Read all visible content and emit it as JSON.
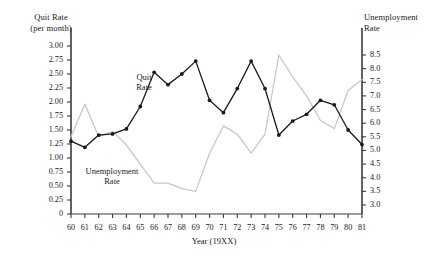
{
  "chart_data": {
    "type": "line",
    "title": "",
    "xlabel": "Year (19XX)",
    "ylabel": "Quit Rate (per month)",
    "y2label": "Unemployment Rate",
    "categories": [
      "60",
      "61",
      "62",
      "63",
      "64",
      "65",
      "66",
      "67",
      "68",
      "69",
      "70",
      "71",
      "72",
      "73",
      "74",
      "75",
      "76",
      "77",
      "78",
      "79",
      "80",
      "81"
    ],
    "ylim": [
      0,
      3.0
    ],
    "y2lim": [
      3.0,
      8.5
    ],
    "yticks": [
      "0",
      "0.25",
      "0.50",
      "0.75",
      "1.00",
      "1.25",
      "1.50",
      "1.75",
      "2.00",
      "2.25",
      "2.50",
      "2.75",
      "3.00"
    ],
    "ytick_values": [
      0,
      0.25,
      0.5,
      0.75,
      1.0,
      1.25,
      1.5,
      1.75,
      2.0,
      2.25,
      2.5,
      2.75,
      3.0
    ],
    "y2ticks": [
      "3.0",
      "3.5",
      "4.0",
      "4.5",
      "5.0",
      "5.5",
      "6.0",
      "6.5",
      "7.0",
      "7.5",
      "8.0",
      "8.5"
    ],
    "y2tick_values": [
      3.0,
      3.5,
      4.0,
      4.5,
      5.0,
      5.5,
      6.0,
      6.5,
      7.0,
      7.5,
      8.0,
      8.5
    ],
    "grid": false,
    "legend_position": "inline-annotations",
    "series": [
      {
        "name": "Quit Rate",
        "axis": "left",
        "color": "#1a1a1a",
        "markers": true,
        "values": [
          1.3,
          1.19,
          1.41,
          1.43,
          1.52,
          1.92,
          2.53,
          2.31,
          2.5,
          2.73,
          2.03,
          1.81,
          2.24,
          2.73,
          2.24,
          1.41,
          1.66,
          1.78,
          2.03,
          1.95,
          1.5,
          1.24
        ]
      },
      {
        "name": "Unemployment Rate",
        "axis": "right",
        "color": "#c8c8c8",
        "markers": false,
        "values": [
          5.5,
          6.7,
          5.5,
          5.7,
          5.2,
          4.5,
          3.8,
          3.8,
          3.6,
          3.5,
          4.9,
          5.9,
          5.6,
          4.9,
          5.6,
          8.5,
          7.7,
          7.0,
          6.1,
          5.8,
          7.2,
          7.6
        ]
      }
    ],
    "annotations": [
      {
        "name": "quit-rate-label",
        "text": "Quit\nRate"
      },
      {
        "name": "unemployment-rate-label",
        "text": "Unemployment\nRate"
      }
    ]
  },
  "axis": {
    "left_title": "Quit Rate\n(per month)",
    "right_title": "Unemployment\nRate",
    "x_title": "Year (19XX)"
  },
  "colors": {
    "quit_rate": "#1a1a1a",
    "unemployment_rate": "#c8c8c8",
    "axis": "#3a3a3a",
    "background": "#ffffff"
  }
}
